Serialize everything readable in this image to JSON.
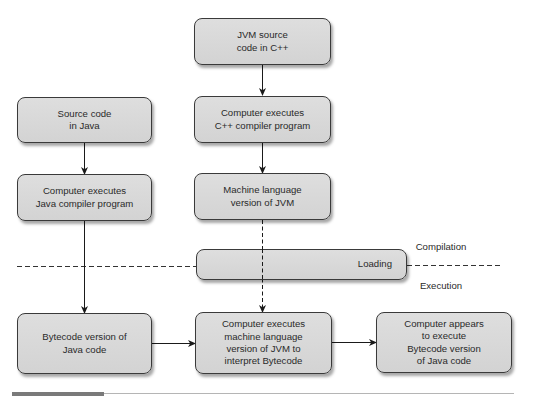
{
  "diagram": {
    "type": "flowchart",
    "colors": {
      "node_fill": "#d6d6d6",
      "node_border": "#3a3a3a",
      "line": "#222222",
      "background": "#ffffff",
      "rule_dark": "#7a7a7a",
      "rule_light": "#b5b5b5"
    },
    "nodes": {
      "jvm_source": {
        "label": "JVM source\ncode in C++"
      },
      "cpp_compiler": {
        "label": "Computer executes\nC++ compiler program"
      },
      "machine_jvm": {
        "label": "Machine language\nversion of JVM"
      },
      "java_source": {
        "label": "Source code\nin Java"
      },
      "java_compiler": {
        "label": "Computer executes\nJava compiler program"
      },
      "loading": {
        "label": "Loading"
      },
      "bytecode": {
        "label": "Bytecode version of\nJava code"
      },
      "interpret": {
        "label": "Computer executes\nmachine language\nversion of JVM to\ninterpret Bytecode"
      },
      "appears": {
        "label": "Computer appears\nto execute\nBytecode version\nof Java code"
      }
    },
    "phases": {
      "compilation": "Compilation",
      "execution": "Execution"
    },
    "edges": [
      {
        "from": "jvm_source",
        "to": "cpp_compiler",
        "style": "solid"
      },
      {
        "from": "cpp_compiler",
        "to": "machine_jvm",
        "style": "solid"
      },
      {
        "from": "java_source",
        "to": "java_compiler",
        "style": "solid"
      },
      {
        "from": "java_compiler",
        "to": "bytecode",
        "style": "solid"
      },
      {
        "from": "machine_jvm",
        "to": "interpret",
        "style": "dashed",
        "via": "loading"
      },
      {
        "from": "bytecode",
        "to": "interpret",
        "style": "solid"
      },
      {
        "from": "interpret",
        "to": "appears",
        "style": "solid"
      }
    ],
    "divider": {
      "style": "dashed",
      "separates": [
        "Compilation",
        "Execution"
      ]
    }
  }
}
